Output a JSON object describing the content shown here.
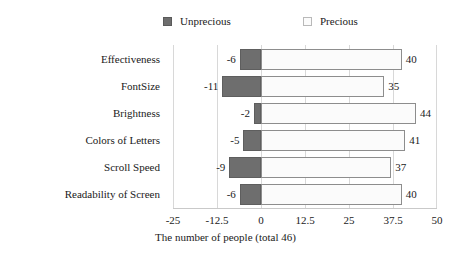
{
  "chart_data": {
    "type": "bar",
    "orientation": "horizontal",
    "stacked": "diverging",
    "title": "",
    "xlabel": "The number of people (total 46)",
    "ylabel": "",
    "xlim": [
      -25,
      50
    ],
    "xticks": [
      "-25",
      "-12.5",
      "0",
      "12.5",
      "25",
      "37.5",
      "50"
    ],
    "xtick_values": [
      -25,
      -12.5,
      0,
      12.5,
      25,
      37.5,
      50
    ],
    "grid": true,
    "legend_position": "top",
    "categories": [
      "Effectiveness",
      "FontSize",
      "Brightness",
      "Colors of Letters",
      "Scroll Speed",
      "Readability of Screen"
    ],
    "series": [
      {
        "name": "Unprecious",
        "color": "#6e6e6e",
        "values": [
          -6,
          -11,
          -2,
          -5,
          -9,
          -6
        ],
        "labels": [
          "-6",
          "-11",
          "-2",
          "-5",
          "-9",
          "-6"
        ]
      },
      {
        "name": "Precious",
        "color": "#fbfbfb",
        "values": [
          40,
          35,
          44,
          41,
          37,
          40
        ],
        "labels": [
          "40",
          "35",
          "44",
          "41",
          "37",
          "40"
        ]
      }
    ]
  },
  "legend": {
    "entries": [
      {
        "label": "Unprecious",
        "swatch": "dark-square-swatch"
      },
      {
        "label": "Precious",
        "swatch": "light-square-swatch"
      }
    ]
  }
}
